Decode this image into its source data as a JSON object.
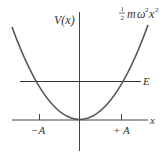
{
  "diagram": {
    "colors": {
      "background": "#ffffff",
      "ink": "#333333",
      "curve": "#555555"
    },
    "labels": {
      "y_axis": "V(x)",
      "x_axis": "x",
      "energy_line": "E",
      "potential_formula": {
        "frac_num": "1",
        "frac_den": "2",
        "m": "m",
        "omega": "ω",
        "omega_exp": "2",
        "x": "x",
        "x_exp": "2"
      },
      "tick_left": "−A",
      "tick_right": "+ A"
    }
  }
}
